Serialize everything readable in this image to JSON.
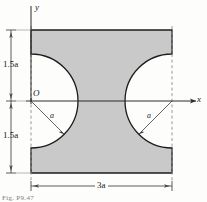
{
  "figure": {
    "axes": {
      "y_label": "y",
      "x_label": "x",
      "origin_label": "O"
    },
    "dimensions": {
      "upper_height": "1.5a",
      "lower_height": "1.5a",
      "width": "3a"
    },
    "radii": {
      "left": "a",
      "right": "a"
    },
    "caption": "Fig. P9.47",
    "colors": {
      "fill": "#c9c9c9",
      "outline": "#1c1c1c",
      "dimension_line": "#4a4a4a",
      "dashed_guide": "#8c8c8c",
      "background": "#fdfdfc"
    },
    "geometry": {
      "rect_left_px": 31,
      "rect_right_px": 172,
      "rect_top_px": 30,
      "rect_bottom_px": 173,
      "axis_y_px": 101,
      "circle_radius_px": 47
    }
  }
}
